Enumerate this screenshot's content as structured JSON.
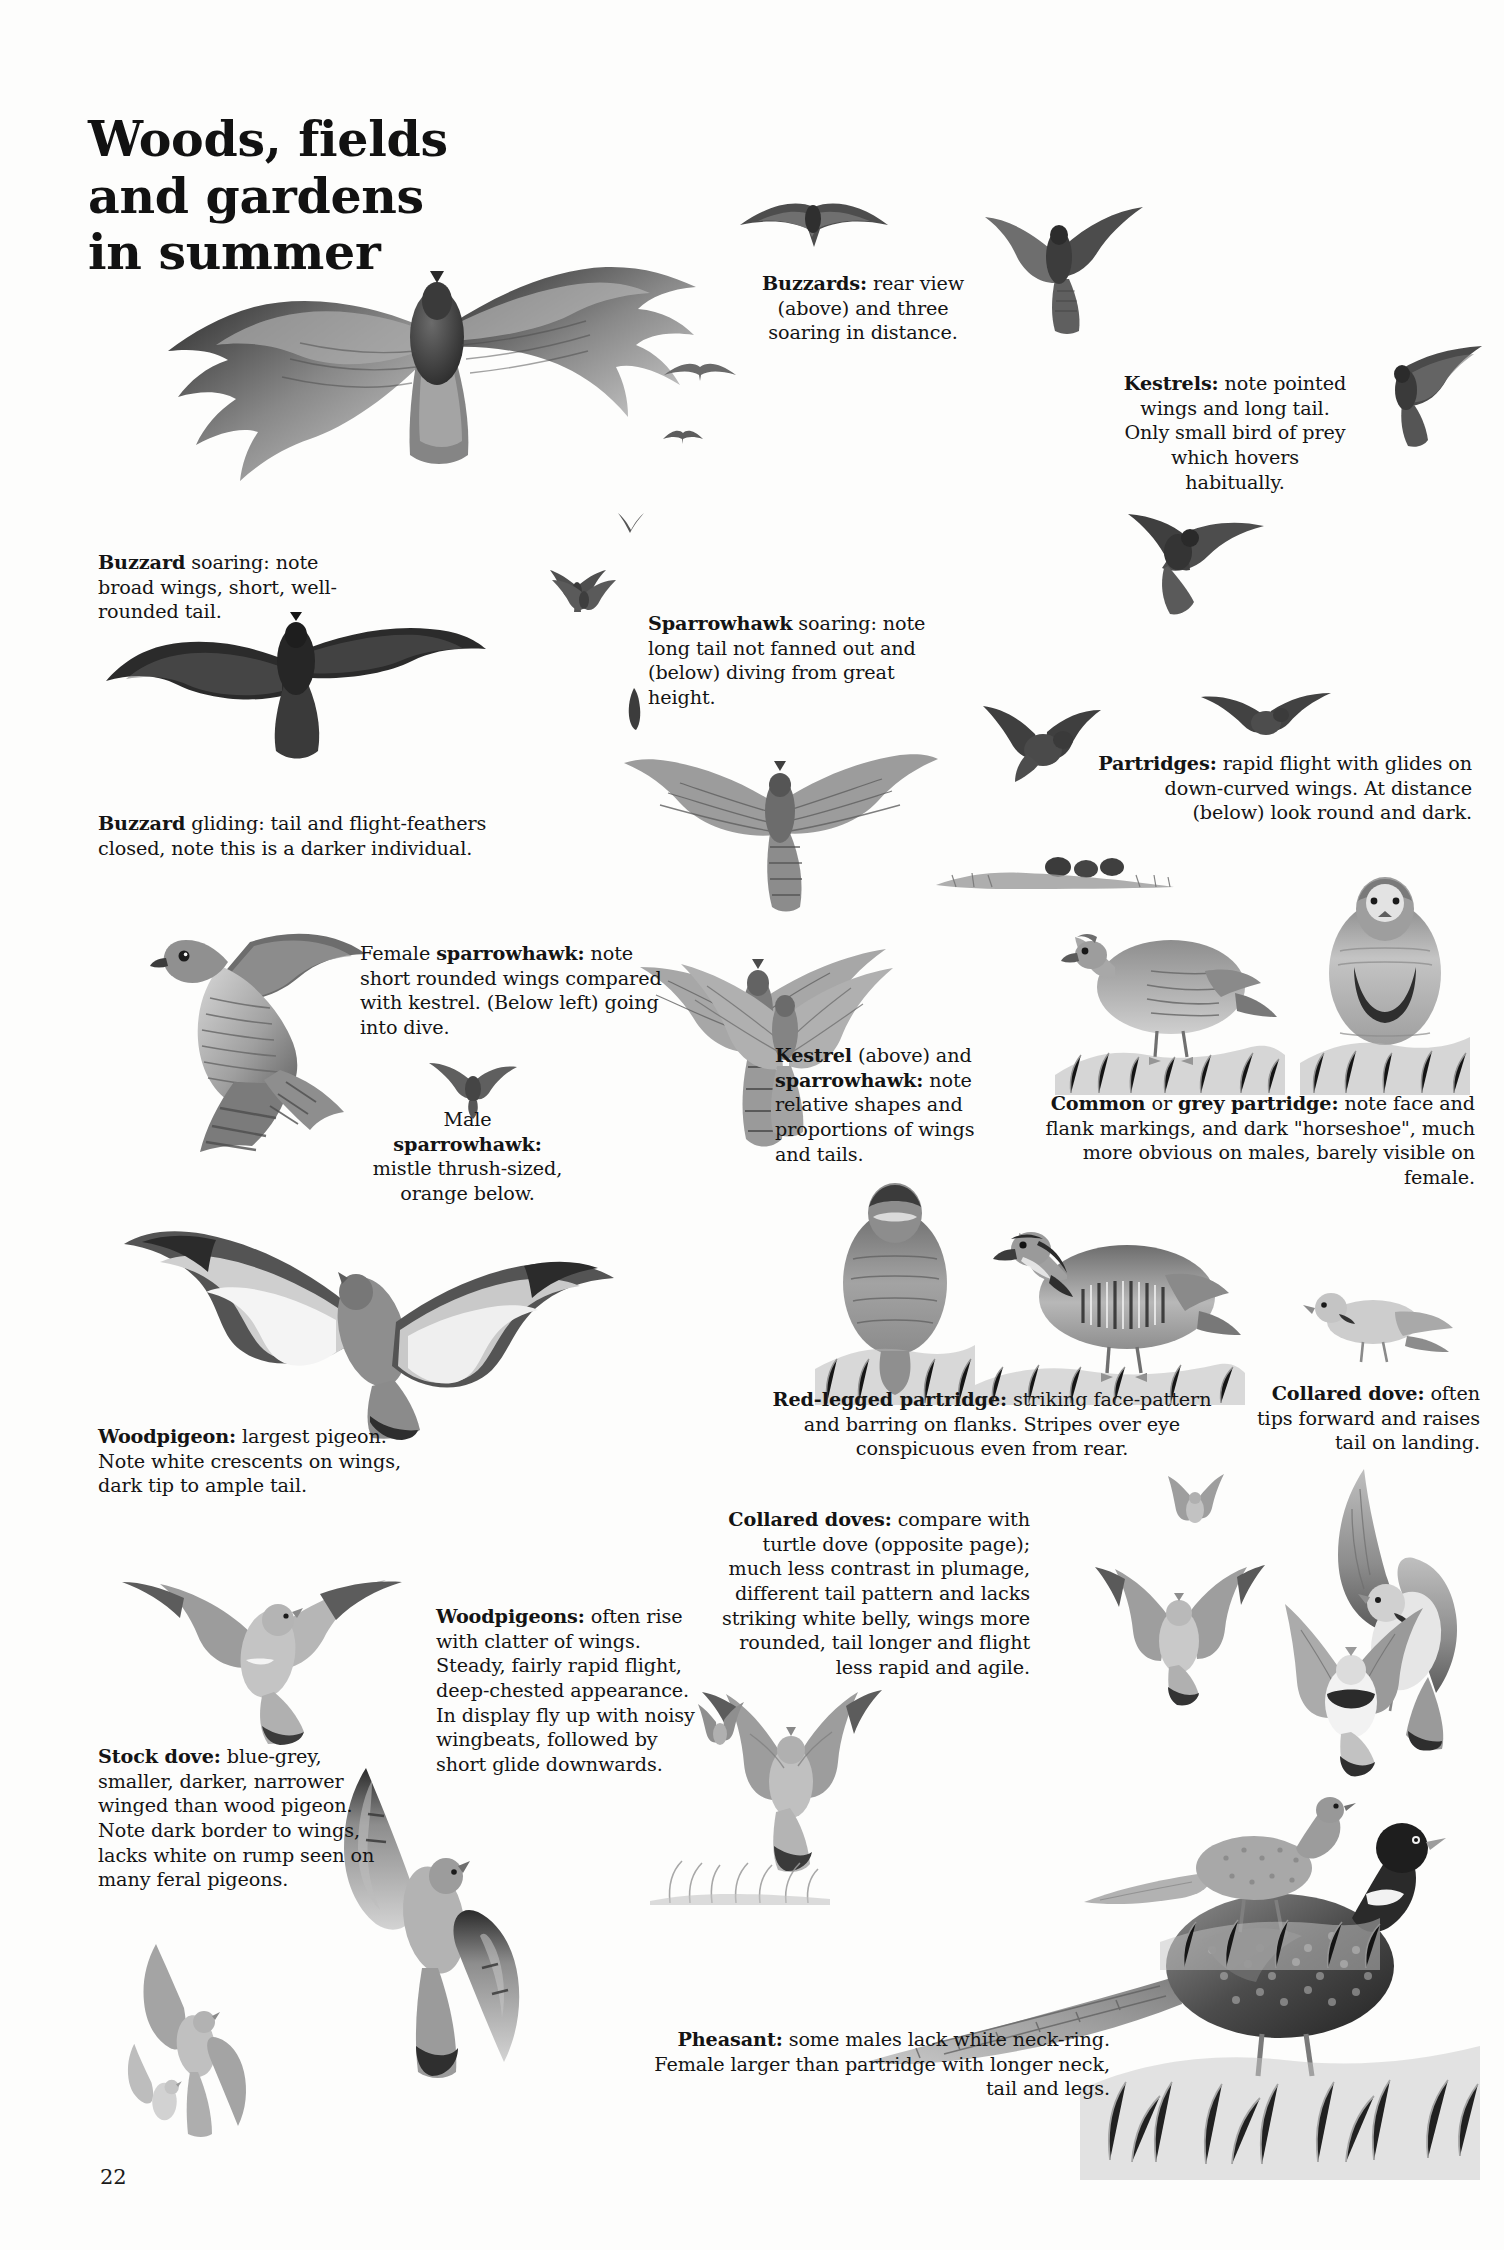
{
  "page": {
    "title_lines": [
      "Woods, fields",
      "and gardens",
      "in summer"
    ],
    "folio": "22",
    "habitat": "Woods, fields and gardens in summer"
  },
  "captions": {
    "buzzards_distance": {
      "lead": "Buzzards:",
      "rest": " rear view (above) and three soaring in distance.",
      "full": "Buzzards: rear view (above) and three soaring in distance.",
      "align": "center"
    },
    "kestrels": {
      "lead": "Kestrels:",
      "rest": " note pointed wings and long tail. Only small bird of prey which hovers habitually.",
      "full": "Kestrels: note pointed wings and long tail. Only small bird of prey which hovers habitually.",
      "align": "center"
    },
    "buzzard_soaring": {
      "lead": "Buzzard",
      "rest": " soaring: note broad wings, short, well-rounded tail.",
      "full": "Buzzard soaring: note broad wings, short, well-rounded tail.",
      "align": "left"
    },
    "sparrowhawk_soaring": {
      "lead": "Sparrowhawk",
      "rest": " soaring: note long tail not fanned out and (below) diving from great height.",
      "full": "Sparrowhawk soaring: note long tail not fanned out and (below) diving from great height.",
      "align": "left"
    },
    "buzzard_gliding": {
      "lead": "Buzzard",
      "rest": " gliding: tail and flight-feathers closed, note this is a darker individual.",
      "full": "Buzzard gliding: tail and flight-feathers closed, note this is a darker individual.",
      "align": "left"
    },
    "partridges": {
      "lead": "Partridges:",
      "rest": " rapid flight with glides on down-curved wings. At distance (below) look round and dark.",
      "full": "Partridges: rapid flight with glides on down-curved wings. At distance (below) look round and dark.",
      "align": "right"
    },
    "female_sparrowhawk": {
      "pre": "Female ",
      "lead": "sparrowhawk:",
      "rest": " note short rounded wings compared with kestrel. (Below left) going into dive.",
      "full": "Female sparrowhawk: note short rounded wings compared with kestrel. (Below left) going into dive.",
      "align": "left"
    },
    "male_sparrowhawk": {
      "pre": "Male ",
      "lead": "sparrowhawk:",
      "rest": " mistle thrush-sized, orange below.",
      "full": "Male sparrowhawk: mistle thrush-sized, orange below.",
      "align": "center"
    },
    "kestrel_and_sparrowhawk": {
      "lead": "Kestrel",
      "mid": " (above) and ",
      "lead2": "sparrowhawk:",
      "rest": " note relative shapes and proportions of wings and tails.",
      "full": "Kestrel (above) and sparrowhawk: note relative shapes and proportions of wings and tails.",
      "align": "left"
    },
    "grey_partridge": {
      "lead": "Common",
      "mid": " or ",
      "lead2": "grey partridge:",
      "rest": " note face and flank markings, and dark \"horseshoe\", much more obvious on males, barely visible on female.",
      "full": "Common or grey partridge: note face and flank markings, and dark “horseshoe”, much more obvious on males, barely visible on female.",
      "align": "right"
    },
    "woodpigeon": {
      "lead": "Woodpigeon:",
      "rest": " largest pigeon. Note white crescents on wings, dark tip to ample tail.",
      "full": "Woodpigeon: largest pigeon. Note white crescents on wings, dark tip to ample tail.",
      "align": "left"
    },
    "red_legged_partridge": {
      "lead": "Red-legged partridge:",
      "rest": " striking face-pattern and barring on flanks. Stripes over eye conspicuous even from rear.",
      "full": "Red-legged partridge: striking face-pattern and barring on flanks. Stripes over eye conspicuous even from rear.",
      "align": "center"
    },
    "collared_dove": {
      "lead": "Collared dove:",
      "rest": " often tips forward and raises tail on landing.",
      "full": "Collared dove: often tips forward and raises tail on landing.",
      "align": "right"
    },
    "collared_doves": {
      "lead": "Collared doves:",
      "rest": " compare with turtle dove (opposite page); much less contrast in plumage, different tail pattern and lacks striking white belly, wings more rounded, tail longer and flight less rapid and agile.",
      "full": "Collared doves: compare with turtle dove (opposite page); much less contrast in plumage, different tail pattern and lacks striking white belly, wings more rounded, tail longer and flight less rapid and agile.",
      "align": "right"
    },
    "woodpigeons_flight": {
      "lead": "Woodpigeons:",
      "rest": " often rise with clatter of wings. Steady, fairly rapid flight, deep-chested appearance. In display fly up with noisy wingbeats, followed by short glide downwards.",
      "full": "Woodpigeons: often rise with clatter of wings. Steady, fairly rapid flight, deep-chested appearance. In display fly up with noisy wingbeats, followed by short glide downwards.",
      "align": "left"
    },
    "stock_dove": {
      "lead": "Stock dove:",
      "rest": " blue-grey, smaller, darker, narrower winged than wood pigeon. Note dark border to wings, lacks white on rump seen on many feral pigeons.",
      "full": "Stock dove: blue-grey, smaller, darker, narrower winged than wood pigeon. Note dark border to wings, lacks white on rump seen on many feral pigeons.",
      "align": "left"
    },
    "pheasant": {
      "lead": "Pheasant:",
      "rest": " some males lack white neck-ring. Female larger than partridge with longer neck, tail and legs.",
      "full": "Pheasant: some males lack white neck-ring. Female larger than partridge with longer neck, tail and legs.",
      "align": "right"
    }
  },
  "illustrations": [
    {
      "name": "buzzard-soaring-large",
      "label": "Buzzard soaring from below, broad wings spread"
    },
    {
      "name": "buzzard-rear-view",
      "label": "Buzzard rear view"
    },
    {
      "name": "buzzard-soaring-distant-1",
      "label": "Distant soaring buzzard"
    },
    {
      "name": "buzzard-soaring-distant-2",
      "label": "Distant soaring buzzard"
    },
    {
      "name": "buzzard-soaring-distant-3",
      "label": "Distant soaring buzzard"
    },
    {
      "name": "buzzard-gliding",
      "label": "Buzzard gliding, dark individual"
    },
    {
      "name": "kestrel-hovering",
      "label": "Kestrel hovering"
    },
    {
      "name": "kestrel-gliding",
      "label": "Kestrel gliding"
    },
    {
      "name": "kestrel-stooping",
      "label": "Kestrel stooping"
    },
    {
      "name": "kestrel-distant",
      "label": "Distant kestrel"
    },
    {
      "name": "sparrowhawk-soaring",
      "label": "Sparrowhawk soaring with long tail"
    },
    {
      "name": "sparrowhawk-diving",
      "label": "Sparrowhawk diving from height"
    },
    {
      "name": "female-sparrowhawk-perched",
      "label": "Female sparrowhawk"
    },
    {
      "name": "male-sparrowhawk-flight",
      "label": "Male sparrowhawk in flight"
    },
    {
      "name": "sparrowhawk-into-dive",
      "label": "Sparrowhawk going into dive"
    },
    {
      "name": "partridge-flight-1",
      "label": "Partridge in rapid flight"
    },
    {
      "name": "partridge-flight-2",
      "label": "Partridge gliding on down-curved wings"
    },
    {
      "name": "partridge-distant-group",
      "label": "Distant partridges, round and dark"
    },
    {
      "name": "grey-partridge-side",
      "label": "Grey partridge side view"
    },
    {
      "name": "grey-partridge-front",
      "label": "Grey partridge front view showing horseshoe"
    },
    {
      "name": "red-legged-partridge-rear",
      "label": "Red-legged partridge rear view"
    },
    {
      "name": "red-legged-partridge-side",
      "label": "Red-legged partridge side view"
    },
    {
      "name": "woodpigeon-flight-upper",
      "label": "Woodpigeon from above with white wing crescents"
    },
    {
      "name": "woodpigeon-gliding",
      "label": "Woodpigeon gliding"
    },
    {
      "name": "woodpigeon-display-flight",
      "label": "Woodpigeon in display flight"
    },
    {
      "name": "stock-dove-flight",
      "label": "Stock dove in flight"
    },
    {
      "name": "stock-dove-distant",
      "label": "Distant stock dove"
    },
    {
      "name": "collared-dove-landing",
      "label": "Collared dove tipping forward on landing"
    },
    {
      "name": "collared-dove-flight-1",
      "label": "Collared dove in flight"
    },
    {
      "name": "collared-dove-flight-2",
      "label": "Collared dove in flight"
    },
    {
      "name": "collared-dove-perched",
      "label": "Collared dove perched"
    },
    {
      "name": "pheasant-male",
      "label": "Male pheasant with long tail"
    },
    {
      "name": "pheasant-female",
      "label": "Female pheasant"
    }
  ]
}
